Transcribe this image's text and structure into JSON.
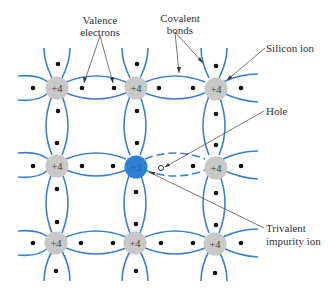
{
  "diagram": {
    "colors": {
      "bond": "#3b7fd4",
      "silicon_ion": "#c8c8c8",
      "impurity_ion": "#2e7fd6",
      "electron": "#111111",
      "leader": "#555555",
      "text": "#333333"
    },
    "labels": {
      "valence_line1": "Valence",
      "valence_line2": "electrons",
      "covalent_line1": "Covalent",
      "covalent_line2": "bonds",
      "silicon_ion": "Silicon ion",
      "hole": "Hole",
      "trivalent_line1": "Trivalent",
      "trivalent_line2": "impurity ion"
    },
    "ions": [
      {
        "row": 0,
        "col": 0,
        "charge": "+4",
        "type": "silicon"
      },
      {
        "row": 0,
        "col": 1,
        "charge": "+4",
        "type": "silicon"
      },
      {
        "row": 0,
        "col": 2,
        "charge": "+4",
        "type": "silicon"
      },
      {
        "row": 1,
        "col": 0,
        "charge": "+4",
        "type": "silicon"
      },
      {
        "row": 1,
        "col": 1,
        "charge": "+3",
        "type": "impurity"
      },
      {
        "row": 1,
        "col": 2,
        "charge": "+4",
        "type": "silicon"
      },
      {
        "row": 2,
        "col": 0,
        "charge": "+4",
        "type": "silicon"
      },
      {
        "row": 2,
        "col": 1,
        "charge": "+4",
        "type": "silicon"
      },
      {
        "row": 2,
        "col": 2,
        "charge": "+4",
        "type": "silicon"
      }
    ]
  }
}
